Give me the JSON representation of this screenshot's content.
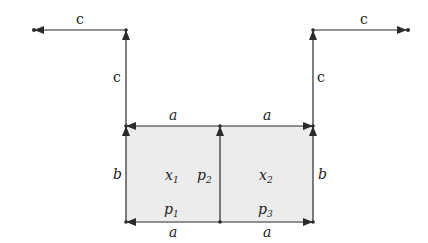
{
  "diagram": {
    "colors": {
      "line": "#2a2a2a",
      "fill": "#ececec",
      "text": "#222222"
    },
    "cells": [
      {
        "id": "x1",
        "label": "x",
        "sub": "1"
      },
      {
        "id": "x2",
        "label": "x",
        "sub": "2"
      }
    ],
    "edges": {
      "top_left_a": "a",
      "top_right_a": "a",
      "bottom_left_a": "a",
      "bottom_right_a": "a",
      "left_b": "b",
      "right_b": "b",
      "left_up_c": "c",
      "right_up_c": "c",
      "left_out_c": "c",
      "right_out_c": "c"
    },
    "points": [
      {
        "id": "p1",
        "label": "p",
        "sub": "1"
      },
      {
        "id": "p2",
        "label": "p",
        "sub": "2"
      },
      {
        "id": "p3",
        "label": "p",
        "sub": "3"
      }
    ]
  }
}
